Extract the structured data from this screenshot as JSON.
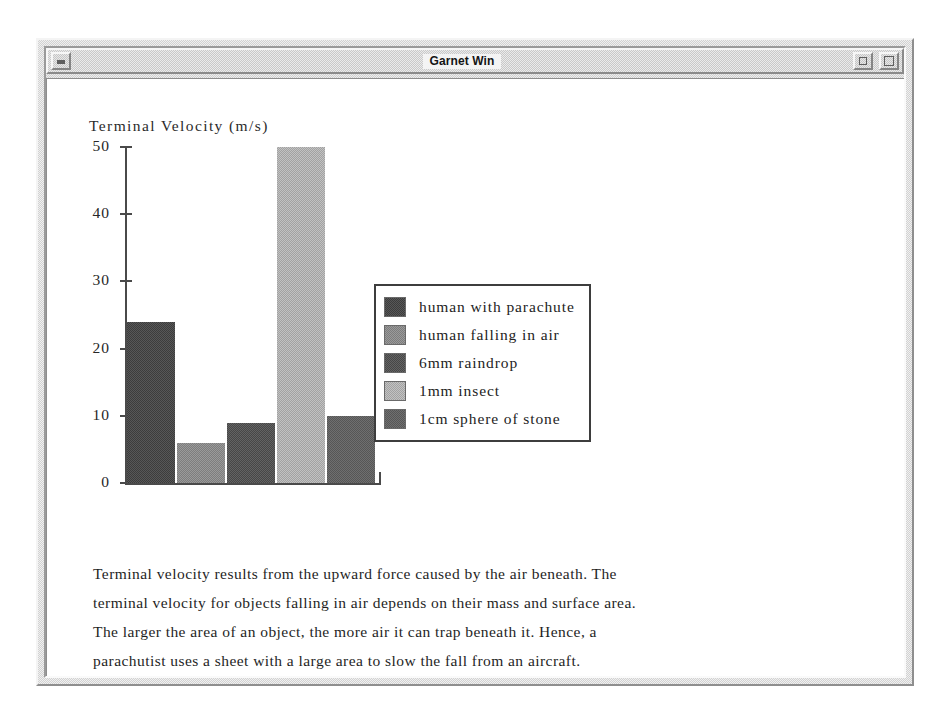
{
  "window": {
    "title": "Garnet Win",
    "buttons": {
      "system_menu": "minimize",
      "restore": "restore",
      "maximize": "maximize"
    }
  },
  "chart_data": {
    "type": "bar",
    "title": "",
    "axis_title": "Terminal Velocity (m/s)",
    "xlabel": "",
    "ylabel": "Terminal Velocity (m/s)",
    "ylim": [
      0,
      50
    ],
    "yticks": [
      0,
      10,
      20,
      30,
      40,
      50
    ],
    "ytick_labels": [
      "0",
      "10",
      "20",
      "30",
      "40",
      "50"
    ],
    "grid": false,
    "legend_position": "center-right",
    "categories": [
      "human with parachute",
      "human falling in air",
      "6mm raindrop",
      "1mm insect",
      "1cm sphere of stone"
    ],
    "values": [
      24,
      6,
      9,
      50,
      10
    ],
    "colors": [
      "#4a4a4a",
      "#8c8c8c",
      "#555555",
      "#b2b2b2",
      "#636363"
    ]
  },
  "legend": {
    "entries": [
      {
        "label": "human with parachute",
        "swatch": "#4a4a4a"
      },
      {
        "label": "human falling in air",
        "swatch": "#8c8c8c"
      },
      {
        "label": "6mm raindrop",
        "swatch": "#555555"
      },
      {
        "label": "1mm insect",
        "swatch": "#b2b2b2"
      },
      {
        "label": "1cm sphere of stone",
        "swatch": "#636363"
      }
    ]
  },
  "body": {
    "paragraph_lines": [
      "Terminal velocity results from the upward force caused by the air beneath. The",
      "terminal velocity for objects falling in air depends on their mass and surface area.",
      "The larger the area of an object, the more air it can trap beneath it. Hence, a",
      "parachutist uses a sheet with a large area to slow the fall from an aircraft."
    ]
  }
}
